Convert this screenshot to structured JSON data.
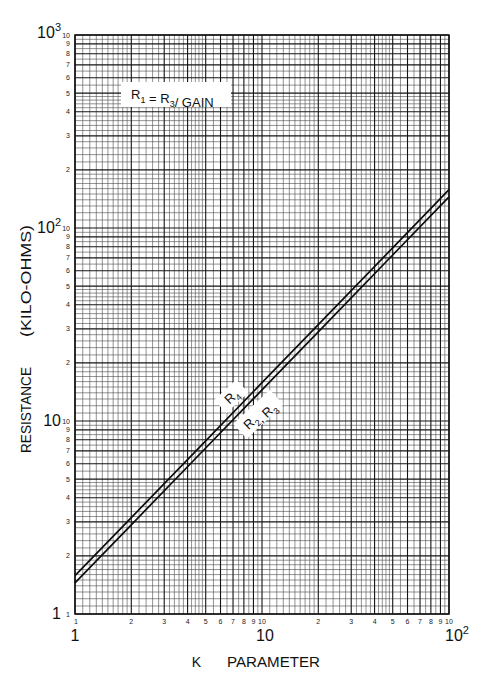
{
  "chart_data": {
    "type": "line",
    "title": "",
    "xlabel": "K PARAMETER",
    "ylabel": "RESISTANCE (KILO-OHMS)",
    "xlabel_parts": [
      "K",
      "PARAMETER"
    ],
    "ylabel_parts": [
      "RESISTANCE",
      "(KILO-OHMS)"
    ],
    "xscale": "log",
    "yscale": "log",
    "xlim": [
      1,
      100
    ],
    "ylim": [
      1,
      1000
    ],
    "grid": true,
    "legend": "none (labels placed inline along the lines)",
    "x_decade_labels": [
      {
        "value": 1,
        "base": "1",
        "exp": ""
      },
      {
        "value": 10,
        "base": "10",
        "exp": ""
      },
      {
        "value": 100,
        "base": "10",
        "exp": "2"
      }
    ],
    "y_decade_labels": [
      {
        "value": 1,
        "base": "1",
        "exp": ""
      },
      {
        "value": 10,
        "base": "10",
        "exp": ""
      },
      {
        "value": 100,
        "base": "10",
        "exp": "2"
      },
      {
        "value": 1000,
        "base": "10",
        "exp": "3"
      }
    ],
    "minor_tick_labels": [
      "1",
      "2",
      "3",
      "4",
      "5",
      "6",
      "7",
      "8",
      "9",
      "10"
    ],
    "series": [
      {
        "name": "R4",
        "label_parts": [
          {
            "t": "R"
          },
          {
            "t": "4",
            "sub": true
          }
        ],
        "x": [
          1,
          2,
          5,
          10,
          20,
          50,
          100
        ],
        "values": [
          1.58,
          3.16,
          7.9,
          15.8,
          31.6,
          79,
          158
        ]
      },
      {
        "name": "R2, R3",
        "label_parts": [
          {
            "t": "R"
          },
          {
            "t": "2",
            "sub": true
          },
          {
            "t": ", R"
          },
          {
            "t": "3",
            "sub": true
          }
        ],
        "x": [
          1,
          2,
          5,
          10,
          20,
          50,
          100
        ],
        "values": [
          1.45,
          2.9,
          7.25,
          14.5,
          29,
          72.5,
          145
        ]
      }
    ],
    "annotations": [
      {
        "text": "R1 = R3/GAIN",
        "parts": [
          {
            "t": "R"
          },
          {
            "t": "1",
            "sub": true
          },
          {
            "t": " = R"
          },
          {
            "t": "3",
            "sub": true
          },
          {
            "t": "/ GAIN"
          }
        ]
      }
    ]
  }
}
